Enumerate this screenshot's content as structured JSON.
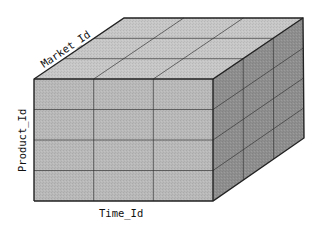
{
  "diagram": {
    "type": "olap-data-cube",
    "dimensions": {
      "depth": {
        "label": "Market_Id",
        "divisions": 3
      },
      "height": {
        "label": "Product_Id",
        "divisions": 4
      },
      "width": {
        "label": "Time_Id",
        "divisions": 3
      }
    },
    "colors": {
      "front_face": "#b9b9b9",
      "top_face": "#c7c7c7",
      "side_face": "#8e8e8e",
      "edges": "#222222",
      "background": "#ffffff"
    }
  }
}
